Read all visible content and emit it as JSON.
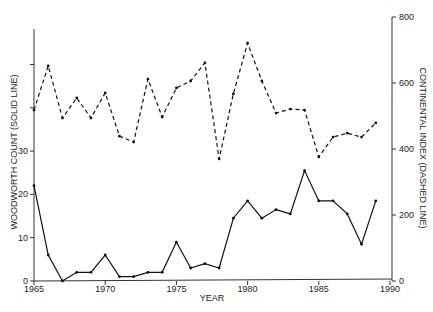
{
  "chart_data": {
    "type": "line",
    "title": "",
    "xlabel": "YEAR",
    "ylabel": "WOODWORTH COUNT (SOLID LINE)",
    "y2label": "CONTINENTAL INDEX (DASHED LINE)",
    "xlim": [
      1965,
      1990
    ],
    "ylim": [
      0,
      60
    ],
    "y2lim": [
      0,
      800
    ],
    "grid": false,
    "legend": "none",
    "x_ticks": [
      1965,
      1970,
      1975,
      1980,
      1985,
      1990
    ],
    "y_ticks": [
      0,
      10,
      20,
      30,
      40,
      50
    ],
    "y_tick_labels": [
      "0",
      "10",
      "20",
      "30",
      "",
      ""
    ],
    "y2_ticks": [
      0,
      200,
      400,
      600,
      800
    ],
    "x": [
      1965,
      1966,
      1967,
      1968,
      1969,
      1970,
      1971,
      1972,
      1973,
      1974,
      1975,
      1976,
      1977,
      1978,
      1979,
      1980,
      1981,
      1982,
      1983,
      1984,
      1985,
      1986,
      1987,
      1988,
      1989
    ],
    "series": [
      {
        "name": "Woodworth Count",
        "axis": "left",
        "style": "solid",
        "values": [
          22,
          6,
          0,
          2,
          2,
          6,
          1,
          1,
          2,
          2,
          9,
          3,
          4,
          3,
          14.5,
          18.5,
          14.5,
          16.5,
          15.5,
          25.5,
          18.5,
          18.5,
          15.5,
          8.5,
          18.5
        ]
      },
      {
        "name": "Continental Index",
        "axis": "right",
        "style": "dashed",
        "values": [
          518,
          652,
          494,
          555,
          494,
          570,
          439,
          421,
          612,
          497,
          585,
          606,
          661,
          370,
          567,
          721,
          606,
          509,
          521,
          518,
          376,
          436,
          448,
          436,
          479
        ]
      }
    ]
  },
  "labels": {
    "x_axis_title": "YEAR",
    "left_axis_title": "WOODWORTH COUNT (SOLID LINE)",
    "right_axis_title": "CONTINENTAL INDEX (DASHED LINE)"
  }
}
